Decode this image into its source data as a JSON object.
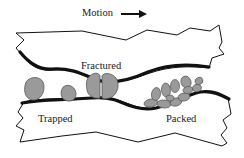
{
  "diagram": {
    "labels": {
      "motion": "Motion",
      "fractured": "Fractured",
      "trapped": "Trapped",
      "packed": "Packed"
    },
    "icons": {
      "motion_arrow": "right-arrow"
    },
    "colors": {
      "outline": "#111111",
      "surface_fill": "#ffffff",
      "particle_fill": "#9a9a9a",
      "particle_stroke": "#555555",
      "background": "#ffffff"
    },
    "regions": [
      {
        "name": "upper-body",
        "description": "Upper surface moving right"
      },
      {
        "name": "lower-body",
        "description": "Lower stationary surface"
      },
      {
        "name": "trapped-particles",
        "count": 2
      },
      {
        "name": "fractured-particle",
        "count": 2
      },
      {
        "name": "packed-particles",
        "count": 12
      }
    ]
  }
}
